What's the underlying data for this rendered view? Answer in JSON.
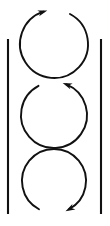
{
  "figure": {
    "kind": "line-diagram",
    "background_color": "#ffffff",
    "stroke_color": "#111111",
    "width": 110,
    "height": 226
  },
  "chart_data": {
    "type": "diagram",
    "title": "",
    "subtitle": "",
    "xlabel": "",
    "ylabel": "",
    "elements": [
      {
        "name": "left-wall",
        "kind": "vertical-line",
        "x": 8,
        "y_start": 39,
        "y_end": 214
      },
      {
        "name": "right-wall",
        "kind": "vertical-line",
        "x": 101,
        "y_start": 39,
        "y_end": 214
      },
      {
        "name": "vortex-top",
        "kind": "circular-arrow",
        "center_x": 54,
        "center_y": 44,
        "radius": 34,
        "gap_position": "top",
        "arrowhead_side": "upper-left",
        "arrowhead_direction": "up",
        "rotation": "clockwise",
        "gap_start_deg": -108,
        "gap_end_deg": -62
      },
      {
        "name": "vortex-middle",
        "kind": "circular-arrow",
        "center_x": 54,
        "center_y": 115,
        "radius": 33,
        "gap_position": "top",
        "arrowhead_side": "upper-right",
        "arrowhead_direction": "up",
        "rotation": "counterclockwise",
        "gap_start_deg": -118,
        "gap_end_deg": -68
      },
      {
        "name": "vortex-bottom",
        "kind": "circular-arrow",
        "center_x": 54,
        "center_y": 181,
        "radius": 32,
        "gap_position": "bottom",
        "arrowhead_side": "lower-right",
        "arrowhead_direction": "down",
        "rotation": "clockwise",
        "gap_start_deg": 62,
        "gap_end_deg": 118
      }
    ],
    "legend": [],
    "annotations": [],
    "grid": false
  }
}
